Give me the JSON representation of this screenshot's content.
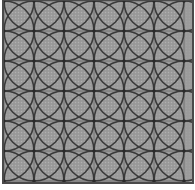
{
  "image": {
    "width": 195,
    "height": 190,
    "title": "Interlocking circles tile pattern",
    "description": "Seamless geometric textile pattern of overlapping circles forming grey pointed-oval petals over a light grid, enclosed by a dark rectangular frame.",
    "background_color": "#ffffff"
  },
  "frame": {
    "name": "outer-border",
    "x": 3,
    "y": 0,
    "width": 190,
    "height": 183,
    "stroke_color": "#4a4a4a",
    "stroke_width": 2,
    "fill_color": "#e9e9e7"
  },
  "pattern": {
    "type": "interlocking-circles",
    "grid_pitch": 30,
    "circle_radius": 30,
    "columns": 7,
    "rows": 7,
    "origin_x": 4,
    "origin_y": 1,
    "petal_fill": "#9c9c9c",
    "petal_stroke": "#3a3a3a",
    "petal_stroke_width": 1.6,
    "background_fill": "#e9e9e7",
    "gridline_color": "#6e6e6e",
    "gridline_width": 0.9,
    "node_color": "#2b2b2b",
    "node_radius": 1.8,
    "texture_opacity": 0.16,
    "circle_centers_x": [
      4,
      34,
      64,
      94,
      124,
      154,
      184
    ],
    "circle_centers_y": [
      1,
      31,
      61,
      91,
      121,
      151,
      181
    ],
    "gridlines_x": [
      4,
      34,
      64,
      94,
      124,
      154,
      184
    ],
    "gridlines_y": [
      1,
      31,
      61,
      91,
      121,
      151,
      181
    ]
  },
  "margins": {
    "left": 3,
    "top": 0,
    "right": 2,
    "bottom": 7,
    "color": "#ffffff"
  }
}
